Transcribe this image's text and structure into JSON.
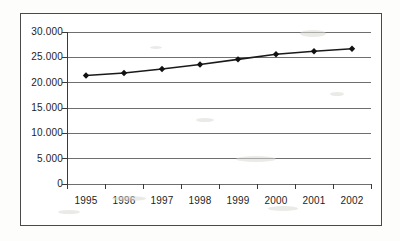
{
  "chart_data": {
    "type": "line",
    "title": "",
    "subtitle": "",
    "xlabel": "",
    "ylabel": "",
    "categories": [
      "1995",
      "1996",
      "1997",
      "1998",
      "1999",
      "2000",
      "2001",
      "2002"
    ],
    "values": [
      21400,
      21900,
      22700,
      23600,
      24600,
      25600,
      26200,
      26700
    ],
    "series": [
      {
        "name": "",
        "values": [
          21400,
          21900,
          22700,
          23600,
          24600,
          25600,
          26200,
          26700
        ]
      }
    ],
    "ylim": [
      0,
      30000
    ],
    "y_ticks": [
      0,
      5000,
      10000,
      15000,
      20000,
      25000,
      30000
    ],
    "y_tick_labels": [
      "0",
      "5.000",
      "10.000",
      "15.000",
      "20.000",
      "25.000",
      "30.000"
    ],
    "x_tick_labels": [
      "1995",
      "1996",
      "1997",
      "1998",
      "1999",
      "2000",
      "2001",
      "2002"
    ],
    "grid": true,
    "legend": "none",
    "marker": "diamond",
    "line_color": "#1a1a1a",
    "marker_color": "#111111",
    "grid_color": "#6e6e6e",
    "axis_color": "#3a3a3a",
    "background_color": "#ffffff",
    "frame_color": "#4a4a4a"
  }
}
